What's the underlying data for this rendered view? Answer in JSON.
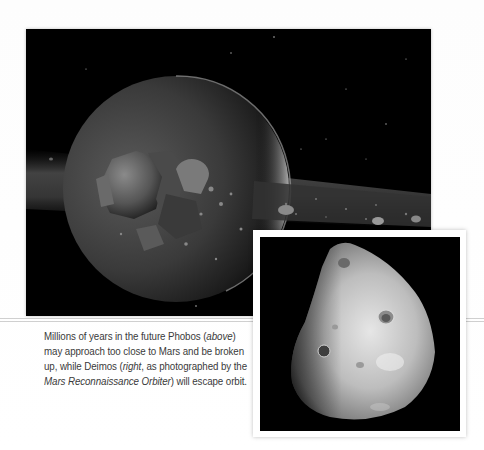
{
  "figure": {
    "main_image": {
      "alt": "Artist rendering of Phobos breaking up into a ring of debris around Mars",
      "subject": "Phobos breaking apart near Mars"
    },
    "inset_image": {
      "alt": "Deimos as photographed by the Mars Reconnaissance Orbiter",
      "subject": "Deimos"
    },
    "caption": {
      "part1": "Millions of years in the future Phobos (",
      "above": "above",
      "part2": ") may approach too close to Mars and be broken up, while Deimos (",
      "right": "right",
      "part3": ", as photographed by the ",
      "orbiter": "Mars Reconnaissance Orbiter",
      "part4": ") will escape orbit."
    }
  },
  "colors": {
    "background": "#ffffff",
    "photo_black": "#000000",
    "caption_text": "#3a3a3a",
    "frame": "#ffffff"
  }
}
